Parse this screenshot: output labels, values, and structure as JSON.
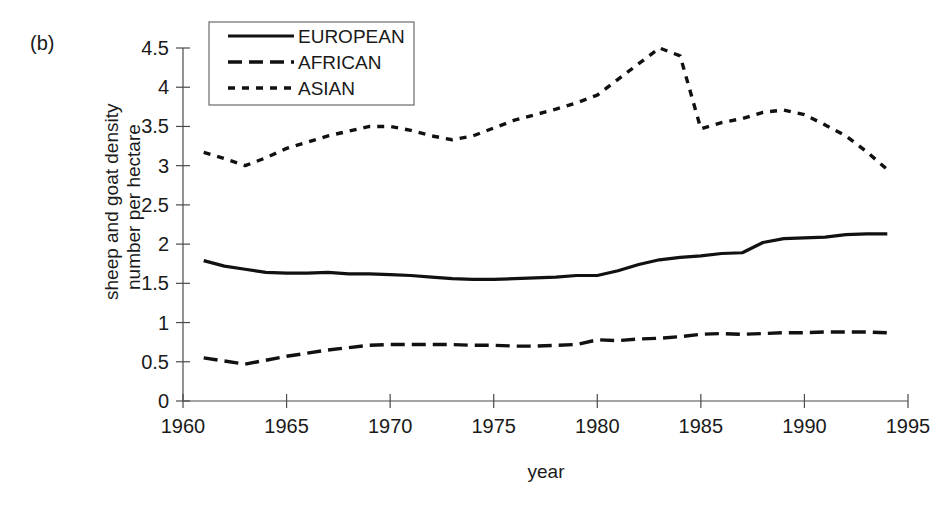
{
  "panel": {
    "label": "(b)"
  },
  "chart_data": {
    "type": "line",
    "title": "",
    "xlabel": "year",
    "ylabel_line1": "sheep and goat density",
    "ylabel_line2": "number per hectare",
    "xlim": [
      1960,
      1995
    ],
    "ylim": [
      0,
      4.5
    ],
    "xticks": [
      1960,
      1965,
      1970,
      1975,
      1980,
      1985,
      1990,
      1995
    ],
    "xtick_labels": [
      "1960",
      "1965",
      "1970",
      "1975",
      "1980",
      "1985",
      "1990",
      "1995"
    ],
    "yticks": [
      0,
      0.5,
      1,
      1.5,
      2,
      2.5,
      3,
      3.5,
      4,
      4.5
    ],
    "ytick_labels": [
      "0",
      "0.5",
      "1",
      "1.5",
      "2",
      "2.5",
      "3",
      "3.5",
      "4",
      "4.5"
    ],
    "grid": false,
    "legend_position": "top-left-inside",
    "x": [
      1961,
      1962,
      1963,
      1964,
      1965,
      1966,
      1967,
      1968,
      1969,
      1970,
      1971,
      1972,
      1973,
      1974,
      1975,
      1976,
      1977,
      1978,
      1979,
      1980,
      1981,
      1982,
      1983,
      1984,
      1985,
      1986,
      1987,
      1988,
      1989,
      1990,
      1991,
      1992,
      1993,
      1994
    ],
    "series": [
      {
        "name": "EUROPEAN",
        "style": "solid",
        "color": "#111111",
        "dash": "none",
        "width": 3.2,
        "values": [
          1.79,
          1.72,
          1.68,
          1.64,
          1.63,
          1.63,
          1.64,
          1.62,
          1.62,
          1.61,
          1.6,
          1.58,
          1.56,
          1.55,
          1.55,
          1.56,
          1.57,
          1.58,
          1.6,
          1.6,
          1.66,
          1.74,
          1.8,
          1.83,
          1.85,
          1.88,
          1.89,
          2.02,
          2.07,
          2.08,
          2.09,
          2.12,
          2.13,
          2.13
        ]
      },
      {
        "name": "AFRICAN",
        "style": "long-dash",
        "color": "#111111",
        "dash": "14,7",
        "width": 3.4,
        "values": [
          0.55,
          0.51,
          0.47,
          0.52,
          0.57,
          0.61,
          0.65,
          0.68,
          0.71,
          0.72,
          0.72,
          0.72,
          0.72,
          0.71,
          0.71,
          0.7,
          0.7,
          0.71,
          0.72,
          0.78,
          0.77,
          0.79,
          0.8,
          0.82,
          0.85,
          0.86,
          0.85,
          0.86,
          0.87,
          0.87,
          0.88,
          0.88,
          0.88,
          0.87
        ]
      },
      {
        "name": "ASIAN",
        "style": "short-dash",
        "color": "#111111",
        "dash": "7,7",
        "width": 3.4,
        "values": [
          3.17,
          3.09,
          3.0,
          3.1,
          3.22,
          3.3,
          3.38,
          3.44,
          3.5,
          3.5,
          3.45,
          3.38,
          3.33,
          3.38,
          3.48,
          3.58,
          3.65,
          3.72,
          3.8,
          3.9,
          4.1,
          4.3,
          4.5,
          4.4,
          3.47,
          3.55,
          3.6,
          3.68,
          3.71,
          3.65,
          3.52,
          3.38,
          3.18,
          2.95
        ]
      }
    ]
  },
  "legend": {
    "items": [
      {
        "label": "EUROPEAN",
        "style": "solid"
      },
      {
        "label": "AFRICAN",
        "style": "long-dash"
      },
      {
        "label": "ASIAN",
        "style": "short-dash"
      }
    ]
  }
}
